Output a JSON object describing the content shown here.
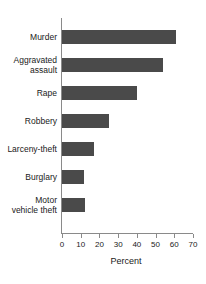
{
  "title_remnant": "",
  "chart_data": {
    "type": "bar",
    "orientation": "horizontal",
    "title": "",
    "xlabel": "Percent",
    "ylabel": "",
    "xlim": [
      0,
      70
    ],
    "xticks": [
      0,
      10,
      20,
      30,
      40,
      50,
      60,
      70
    ],
    "xtick_labels": [
      "0",
      "10",
      "20",
      "30",
      "40",
      "50",
      "60",
      "70"
    ],
    "grid": false,
    "legend": false,
    "bar_color": "#4a4a4a",
    "axis_color": "#8a8a8a",
    "background_color": "#ffffff",
    "categories": [
      "Murder",
      "Aggravated\nassault",
      "Rape",
      "Robbery",
      "Larceny-theft",
      "Burglary",
      "Motor\nvehicle theft"
    ],
    "values": [
      61,
      54,
      40,
      25,
      17,
      12,
      12.5
    ]
  }
}
